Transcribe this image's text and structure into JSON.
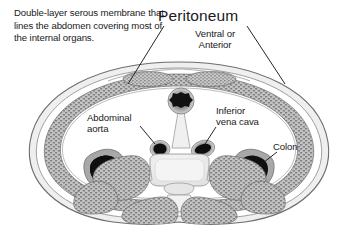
{
  "figure": {
    "kind": "anatomical-cross-section",
    "region": "abdomen transverse section",
    "background_color": "#ffffff",
    "text_color": "#1a1a1a"
  },
  "description": {
    "text": "Double-layer serous membrane that lines the abdomen covering most of the internal organs."
  },
  "title": {
    "text": "Peritoneum"
  },
  "labels": {
    "ventral_anterior": "Ventral or\nAnterior",
    "abdominal_aorta": "Abdominal\naorta",
    "inferior_vena_cava": "Inferior\nvena cava",
    "colon": "Colon"
  },
  "palette": {
    "outline": "#4a4a4a",
    "skin_layer": "#e8e8e8",
    "muscle_fill": "#b0b0b0",
    "muscle_stipple": "#6e6e6e",
    "cavity": "#ffffff",
    "vessel_dark": "#101010",
    "vessel_halo": "#9a9a9a",
    "bone_light": "#f2f2f2",
    "bone_shade": "#d8d8d8",
    "leader_line": "#1a1a1a"
  },
  "structures": [
    {
      "name": "abdominal-wall",
      "label": "Abdominal wall with rectus and oblique musculature"
    },
    {
      "name": "peritoneal-cavity",
      "label": "Peritoneal cavity"
    },
    {
      "name": "umbilical-structure",
      "label": "Midline ventral structure"
    },
    {
      "name": "abdominal-aorta",
      "label": "Abdominal aorta"
    },
    {
      "name": "inferior-vena-cava",
      "label": "Inferior vena cava"
    },
    {
      "name": "colon-left",
      "label": "Colon (left)"
    },
    {
      "name": "colon-right",
      "label": "Colon (right)"
    },
    {
      "name": "vertebral-body",
      "label": "Vertebral body"
    },
    {
      "name": "spinal-canal",
      "label": "Spinal canal"
    },
    {
      "name": "back-muscles",
      "label": "Paraspinal back musculature"
    }
  ]
}
